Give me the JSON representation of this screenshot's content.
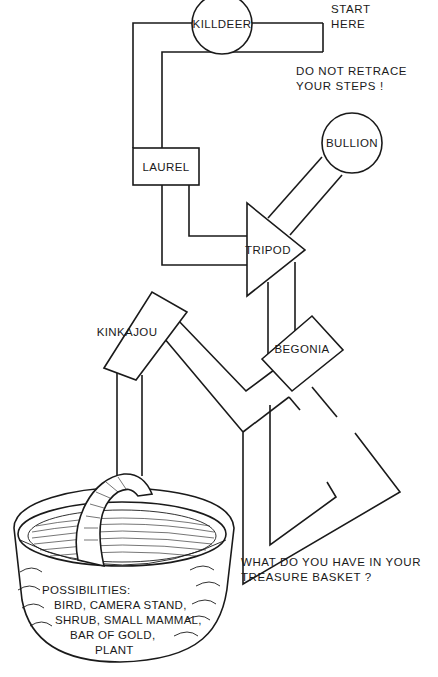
{
  "puzzle": {
    "start_note": [
      "START",
      "HERE"
    ],
    "rule_note": [
      "DO NOT RETRACE",
      "YOUR STEPS !"
    ],
    "question": [
      "WHAT DO YOU HAVE IN YOUR",
      "TREASURE BASKET ?"
    ]
  },
  "nodes": [
    {
      "id": "killdeer",
      "label": "KILLDEER",
      "shape": "circle"
    },
    {
      "id": "laurel",
      "label": "LAUREL",
      "shape": "rectangle"
    },
    {
      "id": "bullion",
      "label": "BULLION",
      "shape": "circle"
    },
    {
      "id": "tripod",
      "label": "TRIPOD",
      "shape": "triangle"
    },
    {
      "id": "kinkajou",
      "label": "KINKAJOU",
      "shape": "rotated-rectangle"
    },
    {
      "id": "begonia",
      "label": "BEGONIA",
      "shape": "rotated-rectangle"
    }
  ],
  "basket": {
    "heading": "POSSIBILITIES:",
    "lines": [
      "BIRD, CAMERA STAND,",
      "SHRUB, SMALL MAMMAL,",
      "BAR OF GOLD,",
      "PLANT"
    ]
  },
  "colors": {
    "ink": "#1a1a1a",
    "paper": "#ffffff"
  }
}
